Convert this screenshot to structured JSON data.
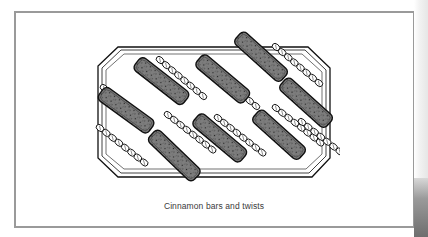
{
  "figure": {
    "caption": "Cinnamon bars and twists",
    "illustration": {
      "subject": "tray of cinnamon bars and twists",
      "items": {
        "bars": 8,
        "twists": 9
      },
      "colors": {
        "bar_fill": "#7d7d7d",
        "outline": "#111111",
        "tray_fill": "#ffffff",
        "frame_border": "#9a9a9a"
      }
    }
  }
}
